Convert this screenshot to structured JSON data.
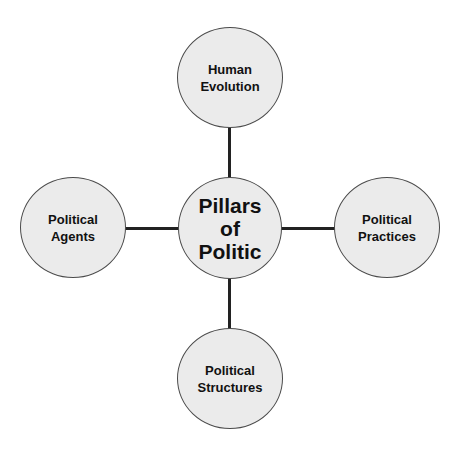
{
  "diagram": {
    "type": "hub-and-spoke",
    "colors": {
      "node_fill": "#ebebeb",
      "node_border": "#4a4a4a",
      "connector": "#222222",
      "text": "#111111"
    },
    "hub": {
      "lines": [
        "Pillars",
        "of",
        "Politic"
      ]
    },
    "satellites": {
      "top": {
        "lines": [
          "Human",
          "Evolution"
        ]
      },
      "left": {
        "lines": [
          "Political",
          "Agents"
        ]
      },
      "right": {
        "lines": [
          "Political",
          "Practices"
        ]
      },
      "bottom": {
        "lines": [
          "Political",
          "Structures"
        ]
      }
    }
  }
}
